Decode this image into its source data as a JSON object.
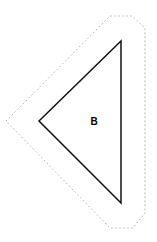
{
  "diagram": {
    "shape": "triangle",
    "label": "B",
    "colors": {
      "stroke": "#111111",
      "outline": "#b0b0b0",
      "background": "#ffffff"
    }
  }
}
